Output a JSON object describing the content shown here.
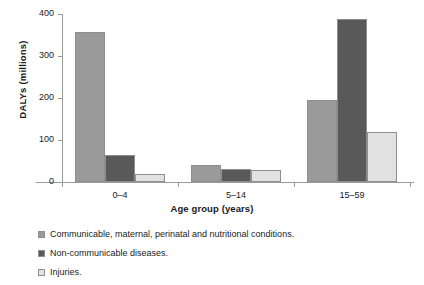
{
  "chart_data": {
    "type": "bar",
    "title": "",
    "xlabel": "Age group (years)",
    "ylabel": "DALYs (millions)",
    "categories": [
      "0–4",
      "5–14",
      "15–59"
    ],
    "ylim": [
      0,
      400
    ],
    "yticks": [
      0,
      100,
      200,
      300,
      400
    ],
    "ytick_labels": [
      "0",
      "100",
      "200",
      "300",
      "400"
    ],
    "grid": false,
    "legend_position": "below",
    "series": [
      {
        "name": "Communicable, maternal, perinatal and nutritional conditions.",
        "color": "#9a9a9a",
        "values": [
          358,
          40,
          196
        ]
      },
      {
        "name": "Non-communicable diseases.",
        "color": "#595959",
        "values": [
          64,
          32,
          388
        ]
      },
      {
        "name": "Injuries.",
        "color": "#e2e2e2",
        "values": [
          19,
          28,
          119
        ]
      }
    ]
  },
  "axes": {
    "y_title": "DALYs (millions)",
    "x_title": "Age group (years)"
  }
}
